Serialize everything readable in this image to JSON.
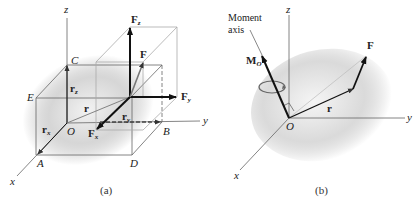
{
  "panel_a": {
    "caption": "(a)",
    "axes": {
      "x": "x",
      "y": "y",
      "z": "z"
    },
    "points": {
      "origin": "O",
      "A": "A",
      "B": "B",
      "C": "C",
      "D": "D",
      "E": "E"
    },
    "vectors": {
      "r": "r",
      "rx": {
        "base": "r",
        "sub": "x"
      },
      "ry": {
        "base": "r",
        "sub": "y"
      },
      "rz": {
        "base": "r",
        "sub": "z"
      },
      "F": "F",
      "Fx": {
        "base": "F",
        "sub": "x"
      },
      "Fy": {
        "base": "F",
        "sub": "y"
      },
      "Fz": {
        "base": "F",
        "sub": "z"
      }
    }
  },
  "panel_b": {
    "caption": "(b)",
    "axes": {
      "x": "x",
      "y": "y",
      "z": "z"
    },
    "origin": "O",
    "moment_axis_label_line1": "Moment",
    "moment_axis_label_line2": "axis",
    "moment": {
      "base": "M",
      "sub": "O"
    },
    "vectors": {
      "r": "r",
      "F": "F"
    }
  },
  "colors": {
    "shading": "#c8c8c8",
    "lines": "#555555",
    "arrows": "#111111",
    "box": "#999999"
  }
}
